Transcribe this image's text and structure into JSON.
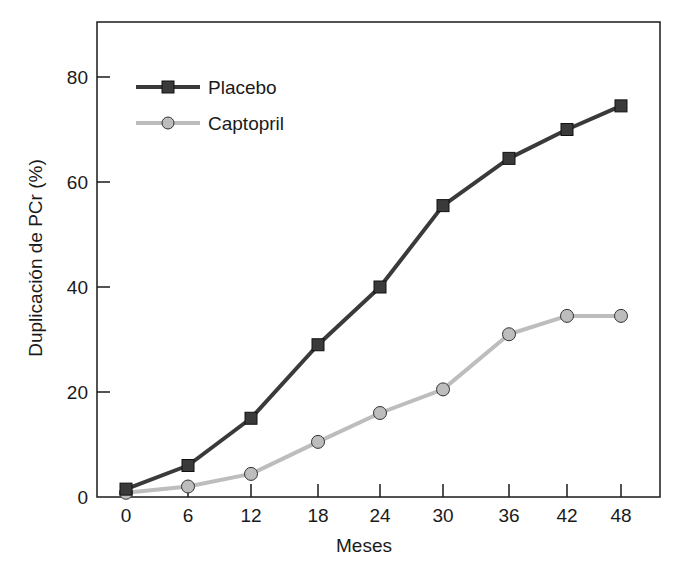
{
  "chart_data": {
    "type": "line",
    "title": "",
    "xlabel": "Meses",
    "ylabel": "Duplicación de PCr (%)",
    "x": [
      0,
      6,
      12,
      18,
      24,
      30,
      36,
      42,
      48
    ],
    "xticks": [
      "0",
      "6",
      "12",
      "18",
      "24",
      "30",
      "36",
      "42",
      "48"
    ],
    "yticks": [
      "0",
      "20",
      "40",
      "60",
      "80"
    ],
    "ylim": [
      0,
      90
    ],
    "xlim": [
      -2,
      52
    ],
    "grid": false,
    "legend_position": "upper left",
    "series": [
      {
        "name": "Placebo",
        "marker": "square",
        "color": "#3a3a3a",
        "values": [
          1.5,
          6,
          15,
          29,
          40,
          55.5,
          64.5,
          70,
          74.5
        ]
      },
      {
        "name": "Captopril",
        "marker": "circle",
        "color": "#bdbdbd",
        "values": [
          0.8,
          2,
          4.4,
          10.5,
          16,
          20.5,
          31,
          34.5,
          34.5
        ]
      }
    ]
  }
}
